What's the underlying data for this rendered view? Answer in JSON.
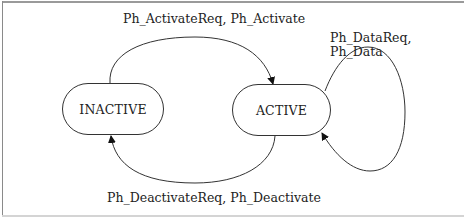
{
  "diagram": {
    "type": "state-machine",
    "states": [
      {
        "id": "inactive",
        "label": "INACTIVE"
      },
      {
        "id": "active",
        "label": "ACTIVE"
      }
    ],
    "transitions": [
      {
        "from": "INACTIVE",
        "to": "ACTIVE",
        "label": "Ph_ActivateReq, Ph_Activate"
      },
      {
        "from": "ACTIVE",
        "to": "INACTIVE",
        "label": "Ph_DeactivateReq, Ph_Deactivate"
      },
      {
        "from": "ACTIVE",
        "to": "ACTIVE",
        "label_lines": [
          "Ph_DataReq,",
          "Ph_Data"
        ]
      }
    ],
    "colors": {
      "stroke": "#333333",
      "text": "#222222",
      "frame": "#9a9a9a",
      "background": "#ffffff"
    }
  }
}
